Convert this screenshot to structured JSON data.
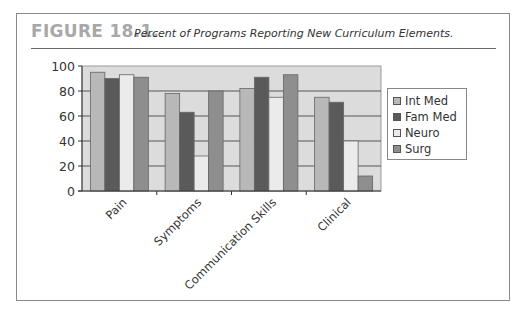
{
  "figure": {
    "label": "FIGURE 18.1.",
    "title": "Percent of Programs Reporting New Curriculum Elements."
  },
  "chart_data": {
    "type": "bar",
    "title": "Percent of Programs Reporting New Curriculum Elements.",
    "xlabel": "",
    "ylabel": "",
    "ylim": [
      0,
      100
    ],
    "yticks": [
      "0",
      "20",
      "40",
      "60",
      "80",
      "100"
    ],
    "grid": true,
    "legend_position": "right",
    "categories": [
      "Pain",
      "Symptoms",
      "Communication Skills",
      "Clinical"
    ],
    "series": [
      {
        "name": "Int Med",
        "color": "#b8b8b8",
        "values": [
          95,
          78,
          82,
          75
        ]
      },
      {
        "name": "Fam Med",
        "color": "#5a5a5a",
        "values": [
          90,
          63,
          91,
          71
        ]
      },
      {
        "name": "Neuro",
        "color": "#ebebeb",
        "values": [
          93,
          28,
          75,
          40
        ]
      },
      {
        "name": "Surg",
        "color": "#8e8e8e",
        "values": [
          91,
          80,
          93,
          12
        ]
      }
    ]
  }
}
